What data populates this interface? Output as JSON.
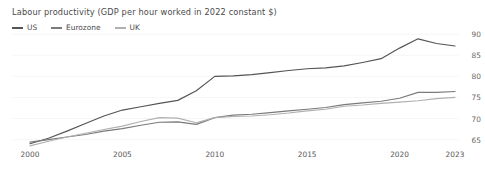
{
  "chart_data": {
    "type": "line",
    "title": "Labour productivity (GDP per hour worked in 2022 constant $)",
    "xlabel": "",
    "ylabel": "",
    "x": [
      2000,
      2001,
      2002,
      2003,
      2004,
      2005,
      2006,
      2007,
      2008,
      2009,
      2010,
      2011,
      2012,
      2013,
      2014,
      2015,
      2016,
      2017,
      2018,
      2019,
      2020,
      2021,
      2022,
      2023
    ],
    "xlim": [
      2000,
      2023
    ],
    "ylim": [
      63,
      91
    ],
    "xticks": [
      "2000",
      "2005",
      "2010",
      "2015",
      "2020",
      "2023"
    ],
    "xtick_values": [
      2000,
      2005,
      2010,
      2015,
      2020,
      2023
    ],
    "yticks": [
      "65",
      "70",
      "75",
      "80",
      "85",
      "90"
    ],
    "ytick_values": [
      65,
      70,
      75,
      80,
      85,
      90
    ],
    "grid": true,
    "legend_position": "top-left",
    "series": [
      {
        "name": "US",
        "color": "#555555",
        "values": [
          64.0,
          65.3,
          67.0,
          68.8,
          70.6,
          72.0,
          72.8,
          73.6,
          74.3,
          76.6,
          80.0,
          80.1,
          80.4,
          80.9,
          81.4,
          81.8,
          82.0,
          82.5,
          83.3,
          84.2,
          86.7,
          88.9,
          87.8,
          87.2
        ]
      },
      {
        "name": "Eurozone",
        "color": "#7a7a7a",
        "values": [
          64.4,
          65.0,
          65.6,
          66.2,
          67.0,
          67.6,
          68.4,
          69.1,
          69.2,
          68.6,
          70.2,
          70.8,
          71.0,
          71.4,
          71.8,
          72.2,
          72.6,
          73.3,
          73.7,
          74.1,
          74.8,
          76.2,
          76.2,
          76.4
        ]
      },
      {
        "name": "UK",
        "color": "#b0b0b0",
        "values": [
          63.5,
          64.6,
          65.6,
          66.5,
          67.4,
          68.2,
          69.3,
          70.2,
          70.1,
          69.0,
          70.2,
          70.5,
          70.6,
          70.9,
          71.3,
          71.8,
          72.2,
          72.9,
          73.2,
          73.6,
          73.9,
          74.2,
          74.7,
          75.0
        ]
      }
    ]
  }
}
